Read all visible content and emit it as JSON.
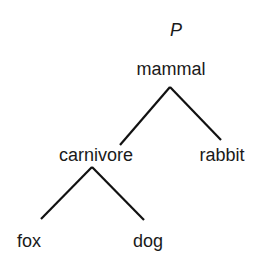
{
  "diagram": {
    "type": "tree",
    "title": "P",
    "colors": {
      "text": "#1a1a1a",
      "edge": "#111111",
      "background": "#ffffff"
    },
    "nodes": {
      "mammal": {
        "label": "mammal",
        "x": 171,
        "y": 75
      },
      "carnivore": {
        "label": "carnivore",
        "x": 96,
        "y": 161
      },
      "rabbit": {
        "label": "rabbit",
        "x": 222,
        "y": 161
      },
      "fox": {
        "label": "fox",
        "x": 29,
        "y": 247
      },
      "dog": {
        "label": "dog",
        "x": 148,
        "y": 247
      }
    },
    "edges": [
      {
        "from": "mammal",
        "to": "carnivore"
      },
      {
        "from": "mammal",
        "to": "rabbit"
      },
      {
        "from": "carnivore",
        "to": "fox"
      },
      {
        "from": "carnivore",
        "to": "dog"
      }
    ]
  }
}
